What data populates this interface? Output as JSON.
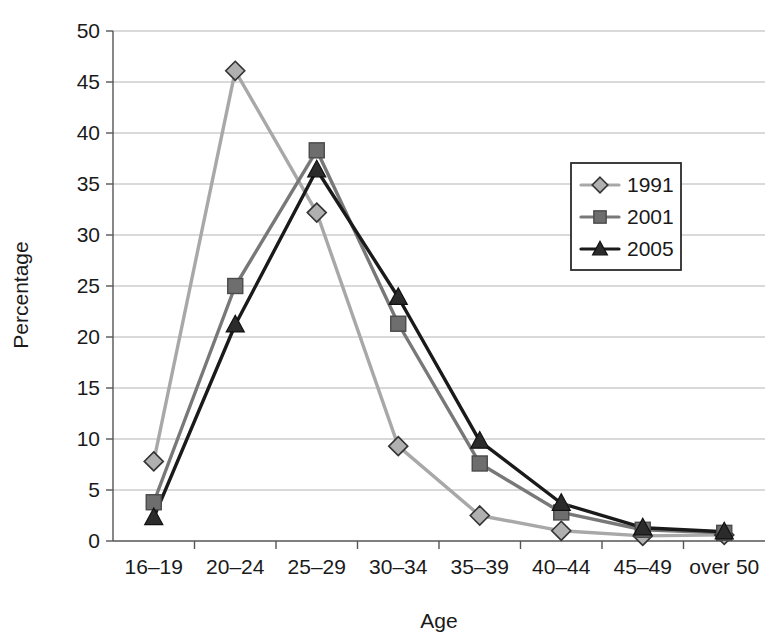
{
  "chart_data": {
    "type": "line",
    "title": "",
    "xlabel": "Age",
    "ylabel": "Percentage",
    "categories": [
      "16–19",
      "20–24",
      "25–29",
      "30–34",
      "35–39",
      "40–44",
      "45–49",
      "over 50"
    ],
    "ylim": [
      0,
      50
    ],
    "yticks": [
      0,
      5,
      10,
      15,
      20,
      25,
      30,
      35,
      40,
      45,
      50
    ],
    "ytick_labels": [
      "0",
      "5",
      "10",
      "15",
      "20",
      "25",
      "30",
      "35",
      "40",
      "45",
      "50"
    ],
    "grid": true,
    "legend_position": "upper-right-inside",
    "series": [
      {
        "name": "1991",
        "marker": "diamond",
        "color": "#a8a8a8",
        "marker_fill": "#b0b0b0",
        "marker_stroke": "#333333",
        "values": [
          7.8,
          46.1,
          32.2,
          9.3,
          2.5,
          1.0,
          0.5,
          0.6
        ]
      },
      {
        "name": "2001",
        "marker": "square",
        "color": "#787878",
        "marker_fill": "#6e6e6e",
        "marker_stroke": "#4a4a4a",
        "values": [
          3.8,
          25.0,
          38.3,
          21.3,
          7.6,
          2.8,
          1.1,
          0.8
        ]
      },
      {
        "name": "2005",
        "marker": "triangle",
        "color": "#1a1a1a",
        "marker_fill": "#2b2b2b",
        "marker_stroke": "#111111",
        "values": [
          2.3,
          21.2,
          36.4,
          23.9,
          9.8,
          3.7,
          1.3,
          0.9
        ]
      }
    ]
  },
  "legend": {
    "entries": [
      "1991",
      "2001",
      "2005"
    ]
  },
  "axes": {
    "x_title": "Age",
    "y_title": "Percentage"
  }
}
